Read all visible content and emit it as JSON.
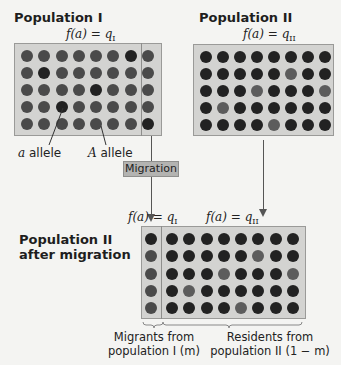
{
  "colors": {
    "A_allele": "#4a4a4a",
    "a_allele": "#222222",
    "A_allele_light": "#5c5c5c",
    "box_fill": "#d3d3d1",
    "migration_fill": "#b3b3b1"
  },
  "population_I": {
    "title": "Population I",
    "formula_prefix": "f(a) = q",
    "formula_sub": "I",
    "rows": 5,
    "cols": 8,
    "dark_cells": [
      [
        0,
        6
      ],
      [
        1,
        1
      ],
      [
        2,
        4
      ],
      [
        3,
        2
      ],
      [
        4,
        7
      ]
    ],
    "labels": {
      "a_allele": "a allele",
      "A_allele": "A allele"
    }
  },
  "population_II": {
    "title": "Population II",
    "formula_prefix": "f(a) = q",
    "formula_sub": "II",
    "rows": 5,
    "cols": 8,
    "light_cells": [
      [
        1,
        5
      ],
      [
        2,
        3
      ],
      [
        2,
        7
      ],
      [
        3,
        1
      ],
      [
        4,
        4
      ]
    ]
  },
  "migration": {
    "label": "Migration"
  },
  "after_migration": {
    "title_line1": "Population II",
    "title_line2": "after migration",
    "formula_migrants_prefix": "f(a) = q",
    "formula_migrants_sub": "I",
    "formula_residents_prefix": "f(a) = q",
    "formula_residents_sub": "II",
    "migrant_rows": 5,
    "migrant_cols": 1,
    "resident_rows": 5,
    "resident_cols": 8,
    "resident_light_cells": [
      [
        1,
        5
      ],
      [
        2,
        3
      ],
      [
        2,
        7
      ],
      [
        3,
        1
      ],
      [
        4,
        4
      ]
    ],
    "migrants_caption_line1": "Migrants from",
    "migrants_caption_line2": "population I (m)",
    "residents_caption_line1": "Residents from",
    "residents_caption_line2": "population II (1 − m)"
  }
}
